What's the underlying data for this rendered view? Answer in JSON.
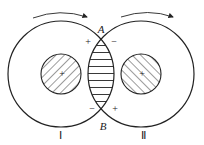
{
  "diagram": {
    "points": {
      "top": "A",
      "bottom": "B"
    },
    "regions": {
      "left": "Ⅰ",
      "right": "Ⅱ"
    },
    "signs": {
      "top_left": "+",
      "top_right": "−",
      "bottom_left": "−",
      "bottom_right": "+",
      "left_core": "+",
      "right_core": "+"
    },
    "arrows": [
      {
        "name": "rotation-arrow-left",
        "direction": "clockwise"
      },
      {
        "name": "rotation-arrow-right",
        "direction": "clockwise"
      }
    ],
    "colors": {
      "stroke": "#222222",
      "background": "#ffffff"
    }
  }
}
